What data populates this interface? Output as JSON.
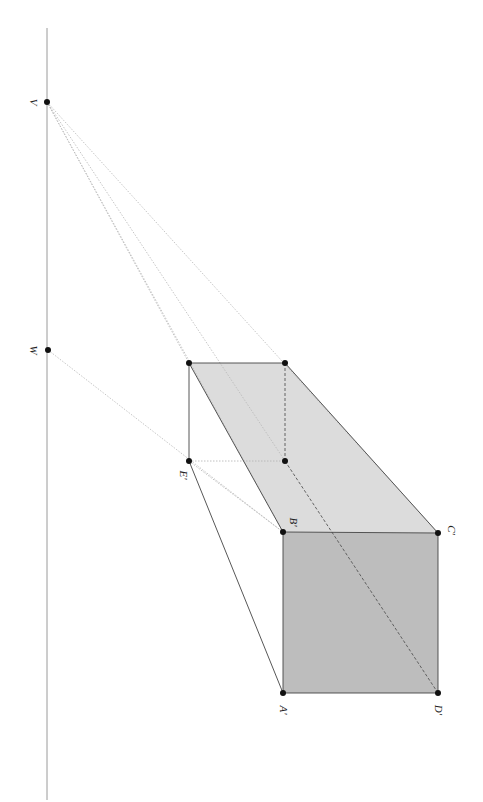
{
  "diagram": {
    "colors": {
      "front_face": "#bdbdbd",
      "top_face": "#dcdcdc",
      "edge": "#444444",
      "horizon": "#9a9a9a",
      "construction": "#b8b8b8",
      "point": "#111111"
    },
    "horizon_line": {
      "x": 47,
      "y1": 28,
      "y2": 800
    },
    "points": {
      "V": {
        "label": "V",
        "x": 47,
        "y": 102,
        "lx": 30,
        "ly": 102
      },
      "W": {
        "label": "W",
        "x": 48,
        "y": 350,
        "lx": 30,
        "ly": 350
      },
      "P1": {
        "label": "",
        "x": 189,
        "y": 363
      },
      "P2": {
        "label": "",
        "x": 285,
        "y": 363
      },
      "E": {
        "label": "E'",
        "x": 189,
        "y": 461,
        "lx": 182,
        "ly": 475
      },
      "P3": {
        "label": "",
        "x": 285,
        "y": 461
      },
      "B": {
        "label": "B'",
        "x": 283,
        "y": 532,
        "lx": 290,
        "ly": 520
      },
      "C": {
        "label": "C'",
        "x": 438,
        "y": 533,
        "lx": 448,
        "ly": 528
      },
      "A": {
        "label": "A'",
        "x": 283,
        "y": 693,
        "lx": 283,
        "ly": 710
      },
      "D": {
        "label": "D'",
        "x": 438,
        "y": 693,
        "lx": 438,
        "ly": 710
      }
    },
    "labels": {
      "V": "V",
      "W": "W",
      "E": "E'",
      "B": "B'",
      "C": "C'",
      "A": "A'",
      "D": "D'"
    }
  }
}
